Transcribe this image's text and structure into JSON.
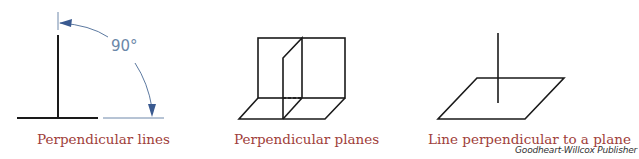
{
  "figures": [
    {
      "caption": "Perpendicular lines",
      "angle_label": "90°"
    },
    {
      "caption": "Perpendicular planes"
    },
    {
      "caption": "Line perpendicular to a plane"
    }
  ],
  "credit": "Goodheart-Willcox Publisher",
  "colors": {
    "caption": "#a0403a",
    "line": "#1a1a1a",
    "dimension": "#4a6a95",
    "angle_text": "#6b87a8"
  }
}
